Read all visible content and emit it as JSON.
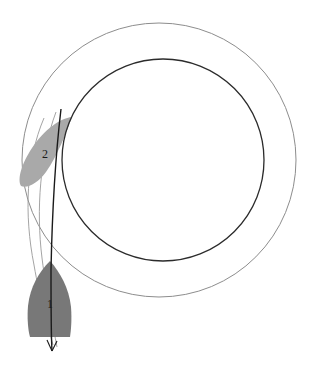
{
  "figure": {
    "title": "",
    "background_color": "#ffffff",
    "width": 313,
    "height": 377
  },
  "orbits": [
    {
      "name": "outer-orbit",
      "cx": 159,
      "cy": 160,
      "r": 137,
      "stroke_color": "#8d8d8d",
      "stroke_width": 1
    },
    {
      "name": "inner-orbit",
      "cx": 163,
      "cy": 160,
      "r": 101,
      "stroke_color": "#2b2b2b",
      "stroke_width": 1.3
    }
  ],
  "bodies": [
    {
      "name": "body-1",
      "label": "1",
      "label_x": 50,
      "label_y": 305,
      "fill_color": "#787878",
      "cx": 49,
      "cy": 299,
      "rx": 25,
      "ry": 38,
      "rotation": -3
    },
    {
      "name": "body-2",
      "label": "2",
      "label_x": 45,
      "label_y": 155,
      "fill_color": "#a9a9a9",
      "cx": 47,
      "cy": 153,
      "rx": 17,
      "ry": 36,
      "rotation": 35
    }
  ],
  "trajectories": [
    {
      "name": "trajectory-outer-light",
      "stroke_color": "#9a9a9a",
      "stroke_width": 0.9
    },
    {
      "name": "trajectory-inner-light",
      "stroke_color": "#9a9a9a",
      "stroke_width": 0.9
    },
    {
      "name": "axis-arrow",
      "stroke_color": "#1a1a1a",
      "stroke_width": 1.4,
      "arrow_tip_x": 52,
      "arrow_tip_y": 351
    }
  ]
}
